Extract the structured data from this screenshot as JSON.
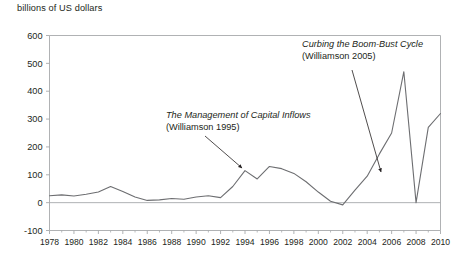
{
  "chart_data": {
    "type": "line",
    "title": "",
    "ylabel": "billions of US dollars",
    "xlabel": "",
    "ylim": [
      -100,
      600
    ],
    "xlim": [
      1978,
      2010
    ],
    "grid": false,
    "legend": "none",
    "y_ticks": [
      600,
      500,
      400,
      300,
      200,
      100,
      0,
      -100
    ],
    "y_tick_labels": [
      "600",
      "500",
      "400",
      "300",
      "200",
      "100",
      "0",
      "-100"
    ],
    "x_ticks": [
      1978,
      1980,
      1982,
      1984,
      1986,
      1988,
      1990,
      1992,
      1994,
      1996,
      1998,
      2000,
      2002,
      2004,
      2006,
      2008,
      2010
    ],
    "x_tick_labels": [
      "1978",
      "1980",
      "1982",
      "1984",
      "1986",
      "1988",
      "1990",
      "1992",
      "1994",
      "1996",
      "1998",
      "2000",
      "2002",
      "2004",
      "2006",
      "2008",
      "2010"
    ],
    "x_minor_ticks": [
      1979,
      1981,
      1983,
      1985,
      1987,
      1989,
      1991,
      1993,
      1995,
      1997,
      1999,
      2001,
      2003,
      2005,
      2007,
      2009
    ],
    "series": [
      {
        "name": "net private capital flows to emerging markets",
        "color": "#6d6e71",
        "x": [
          1978,
          1979,
          1980,
          1981,
          1982,
          1983,
          1984,
          1985,
          1986,
          1987,
          1988,
          1989,
          1990,
          1991,
          1992,
          1993,
          1994,
          1995,
          1996,
          1997,
          1998,
          1999,
          2000,
          2001,
          2002,
          2003,
          2004,
          2005,
          2006,
          2007,
          2008,
          2009,
          2010
        ],
        "values": [
          25,
          28,
          24,
          30,
          38,
          58,
          40,
          20,
          8,
          10,
          15,
          12,
          20,
          25,
          18,
          58,
          115,
          85,
          130,
          122,
          105,
          75,
          38,
          5,
          -8,
          45,
          95,
          175,
          250,
          470,
          0,
          270,
          320
        ]
      }
    ],
    "annotations": [
      {
        "id": "anno-1995",
        "title": "The Management of Capital Inflows",
        "citation": "(Williamson 1995)",
        "text_x": 166,
        "text_y": 118,
        "arrow_from_x": 205,
        "arrow_from_y": 136,
        "arrow_to_x": 242,
        "arrow_to_y": 168
      },
      {
        "id": "anno-2005",
        "title": "Curbing the Boom-Bust Cycle",
        "citation": "(Williamson 2005)",
        "text_x": 302,
        "text_y": 47,
        "arrow_from_x": 352,
        "arrow_from_y": 70,
        "arrow_to_x": 381,
        "arrow_to_y": 172
      }
    ],
    "colors": {
      "line": "#6d6e71",
      "axis": "#a7a9ac",
      "text": "#231f20",
      "background": "#ffffff"
    }
  }
}
